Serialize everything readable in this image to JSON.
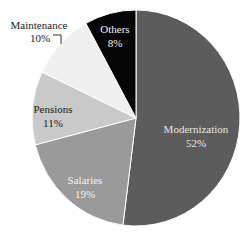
{
  "chart_data": {
    "type": "pie",
    "title": "",
    "start_angle_deg": 0,
    "direction": "clockwise",
    "slices": [
      {
        "label": "Modernization",
        "value": 52,
        "display": "52%",
        "color": "#5c5c5c",
        "text_color": "#e6e6e6"
      },
      {
        "label": "Salaries",
        "value": 19,
        "display": "19%",
        "color": "#9a9a9a",
        "text_color": "#f2f2f2"
      },
      {
        "label": "Pensions",
        "value": 11,
        "display": "11%",
        "color": "#c9c9c9",
        "text_color": "#1a1a1a"
      },
      {
        "label": "Maintenance",
        "value": 10,
        "display": "10%",
        "color": "#f0f0f0",
        "text_color": "#1a1a1a",
        "label_outside": true
      },
      {
        "label": "Others",
        "value": 8,
        "display": "8%",
        "color": "#050505",
        "text_color": "#f2f2f2"
      }
    ],
    "categories": [
      "Modernization",
      "Salaries",
      "Pensions",
      "Maintenance",
      "Others"
    ],
    "values": [
      52,
      19,
      11,
      10,
      8
    ],
    "unit": "%"
  },
  "labels": {
    "modernization": {
      "name": "Modernization",
      "pct": "52%"
    },
    "salaries": {
      "name": "Salaries",
      "pct": "19%"
    },
    "pensions": {
      "name": "Pensions",
      "pct": "11%"
    },
    "maintenance": {
      "name": "Maintenance",
      "pct": "10%"
    },
    "others": {
      "name": "Others",
      "pct": "8%"
    }
  }
}
